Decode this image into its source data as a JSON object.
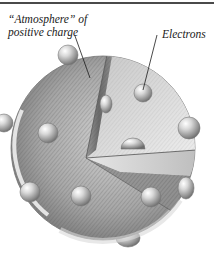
{
  "figure": {
    "labels": {
      "atmosphere_line1": "“Atmosphere” of",
      "atmosphere_line2": "positive charge",
      "electrons": "Electrons"
    },
    "colors": {
      "rule": "#4a4a4a",
      "sphere_light": "#e4e4e4",
      "sphere_mid": "#a8a8a8",
      "sphere_dark": "#6e6e6e",
      "wedge_vertical": "#7a7a7a",
      "wedge_top": "#d8d8d8",
      "wedge_floor": "#bcbcbc",
      "electron_light": "#f2f2f2",
      "electron_dark": "#8a8a8a",
      "leader_line": "#1a1a1a"
    },
    "sphere": {
      "cx": 103,
      "cy": 148,
      "r": 92
    },
    "electrons": [
      {
        "cx": 68,
        "cy": 55,
        "r": 10
      },
      {
        "cx": 143,
        "cy": 93,
        "r": 9
      },
      {
        "cx": 106,
        "cy": 104,
        "r": 7
      },
      {
        "cx": 48,
        "cy": 133,
        "r": 10
      },
      {
        "cx": 189,
        "cy": 128,
        "r": 11
      },
      {
        "cx": 133,
        "cy": 141,
        "r": 11
      },
      {
        "cx": 4,
        "cy": 123,
        "r": 9
      },
      {
        "cx": 30,
        "cy": 192,
        "r": 10
      },
      {
        "cx": 81,
        "cy": 196,
        "r": 10
      },
      {
        "cx": 151,
        "cy": 197,
        "r": 10
      },
      {
        "cx": 185,
        "cy": 188,
        "r": 9
      },
      {
        "cx": 128,
        "cy": 238,
        "r": 10
      }
    ]
  }
}
